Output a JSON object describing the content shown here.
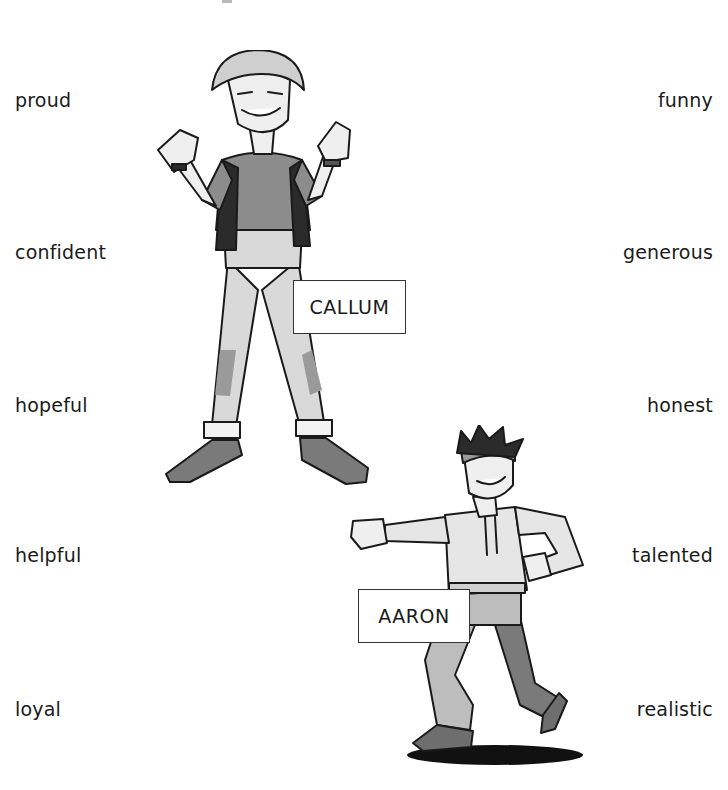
{
  "worksheet": {
    "left_words": [
      {
        "text": "proud",
        "top": 88
      },
      {
        "text": "confident",
        "top": 240
      },
      {
        "text": "hopeful",
        "top": 393
      },
      {
        "text": "helpful",
        "top": 543
      },
      {
        "text": "loyal",
        "top": 697
      }
    ],
    "right_words": [
      {
        "text": "funny",
        "top": 88
      },
      {
        "text": "generous",
        "top": 240
      },
      {
        "text": "honest",
        "top": 393
      },
      {
        "text": "talented",
        "top": 543
      },
      {
        "text": "realistic",
        "top": 697
      }
    ],
    "characters": [
      {
        "name": "CALLUM",
        "pose": "thumbs pointing at self, standing wide",
        "label_box": {
          "left": 293,
          "top": 280,
          "width": 113,
          "height": 54
        }
      },
      {
        "name": "AARON",
        "pose": "dancing, arm pointing outward",
        "label_box": {
          "left": 358,
          "top": 589,
          "width": 112,
          "height": 54
        }
      }
    ],
    "colors": {
      "background": "#ffffff",
      "text": "#1a1a1a",
      "outline": "#1a1a1a",
      "shade_light": "#d9d9d9",
      "shade_mid": "#9a9a9a",
      "shade_dark": "#555555"
    }
  }
}
